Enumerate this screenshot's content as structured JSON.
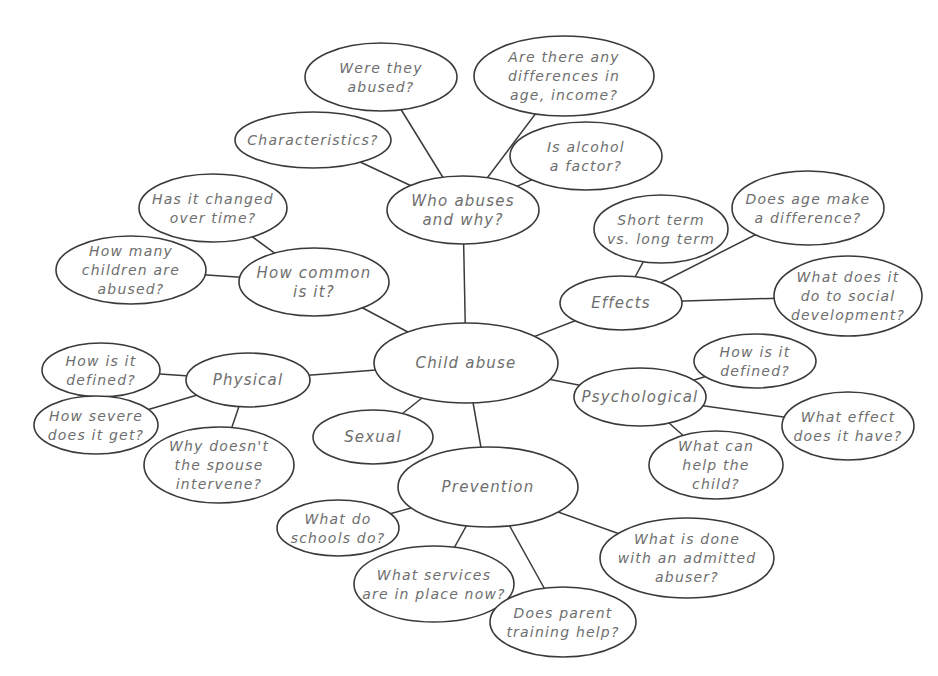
{
  "diagram": {
    "type": "mind-map",
    "colors": {
      "stroke": "#3a3a3a",
      "text": "#6e6e6e",
      "background": "#ffffff"
    },
    "nodes": [
      {
        "id": "child-abuse",
        "lines": [
          "Child abuse"
        ],
        "cx": 466,
        "cy": 363,
        "rx": 92,
        "ry": 40,
        "big": true
      },
      {
        "id": "who-abuses",
        "lines": [
          "Who abuses",
          "and why?"
        ],
        "cx": 463,
        "cy": 210,
        "rx": 76,
        "ry": 34,
        "big": true
      },
      {
        "id": "were-they-abused",
        "lines": [
          "Were they",
          "abused?"
        ],
        "cx": 381,
        "cy": 77,
        "rx": 76,
        "ry": 34
      },
      {
        "id": "differences",
        "lines": [
          "Are there any",
          "differences in",
          "age, income?"
        ],
        "cx": 564,
        "cy": 76,
        "rx": 90,
        "ry": 40
      },
      {
        "id": "characteristics",
        "lines": [
          "Characteristics?"
        ],
        "cx": 313,
        "cy": 140,
        "rx": 78,
        "ry": 28
      },
      {
        "id": "alcohol",
        "lines": [
          "Is alcohol",
          "a factor?"
        ],
        "cx": 586,
        "cy": 156,
        "rx": 76,
        "ry": 34
      },
      {
        "id": "how-common",
        "lines": [
          "How common",
          "is it?"
        ],
        "cx": 314,
        "cy": 282,
        "rx": 75,
        "ry": 34,
        "big": true
      },
      {
        "id": "changed-over-time",
        "lines": [
          "Has it changed",
          "over time?"
        ],
        "cx": 213,
        "cy": 208,
        "rx": 74,
        "ry": 34
      },
      {
        "id": "how-many-children",
        "lines": [
          "How many",
          "children are",
          "abused?"
        ],
        "cx": 131,
        "cy": 270,
        "rx": 75,
        "ry": 34
      },
      {
        "id": "effects",
        "lines": [
          "Effects"
        ],
        "cx": 621,
        "cy": 303,
        "rx": 61,
        "ry": 27,
        "big": true
      },
      {
        "id": "short-long-term",
        "lines": [
          "Short term",
          "vs. long term"
        ],
        "cx": 661,
        "cy": 229,
        "rx": 67,
        "ry": 34
      },
      {
        "id": "age-difference",
        "lines": [
          "Does age make",
          "a difference?"
        ],
        "cx": 808,
        "cy": 208,
        "rx": 76,
        "ry": 37
      },
      {
        "id": "social-development",
        "lines": [
          "What does it",
          "do to social",
          "development?"
        ],
        "cx": 848,
        "cy": 296,
        "rx": 74,
        "ry": 40
      },
      {
        "id": "psychological",
        "lines": [
          "Psychological"
        ],
        "cx": 640,
        "cy": 397,
        "rx": 66,
        "ry": 29,
        "big": true
      },
      {
        "id": "psych-defined",
        "lines": [
          "How is it",
          "defined?"
        ],
        "cx": 755,
        "cy": 361,
        "rx": 61,
        "ry": 27
      },
      {
        "id": "what-effect",
        "lines": [
          "What effect",
          "does it have?"
        ],
        "cx": 848,
        "cy": 426,
        "rx": 66,
        "ry": 34
      },
      {
        "id": "help-child",
        "lines": [
          "What can",
          "help the",
          "child?"
        ],
        "cx": 716,
        "cy": 465,
        "rx": 67,
        "ry": 34
      },
      {
        "id": "physical",
        "lines": [
          "Physical"
        ],
        "cx": 248,
        "cy": 380,
        "rx": 62,
        "ry": 27,
        "big": true
      },
      {
        "id": "phys-defined",
        "lines": [
          "How is it",
          "defined?"
        ],
        "cx": 101,
        "cy": 370,
        "rx": 59,
        "ry": 27
      },
      {
        "id": "how-severe",
        "lines": [
          "How severe",
          "does it get?"
        ],
        "cx": 96,
        "cy": 425,
        "rx": 62,
        "ry": 29
      },
      {
        "id": "spouse-intervene",
        "lines": [
          "Why doesn't",
          "the spouse",
          "intervene?"
        ],
        "cx": 219,
        "cy": 465,
        "rx": 75,
        "ry": 38
      },
      {
        "id": "sexual",
        "lines": [
          "Sexual"
        ],
        "cx": 373,
        "cy": 437,
        "rx": 60,
        "ry": 27,
        "big": true
      },
      {
        "id": "prevention",
        "lines": [
          "Prevention"
        ],
        "cx": 488,
        "cy": 487,
        "rx": 90,
        "ry": 40,
        "big": true
      },
      {
        "id": "schools",
        "lines": [
          "What do",
          "schools do?"
        ],
        "cx": 338,
        "cy": 528,
        "rx": 61,
        "ry": 28
      },
      {
        "id": "services",
        "lines": [
          "What services",
          "are in place now?"
        ],
        "cx": 434,
        "cy": 584,
        "rx": 80,
        "ry": 38
      },
      {
        "id": "parent-training",
        "lines": [
          "Does parent",
          "training help?"
        ],
        "cx": 563,
        "cy": 622,
        "rx": 73,
        "ry": 35
      },
      {
        "id": "admitted-abuser",
        "lines": [
          "What is done",
          "with an admitted",
          "abuser?"
        ],
        "cx": 687,
        "cy": 558,
        "rx": 87,
        "ry": 40
      }
    ],
    "edges": [
      [
        "child-abuse",
        "who-abuses"
      ],
      [
        "who-abuses",
        "were-they-abused"
      ],
      [
        "who-abuses",
        "differences"
      ],
      [
        "who-abuses",
        "characteristics"
      ],
      [
        "who-abuses",
        "alcohol"
      ],
      [
        "child-abuse",
        "how-common"
      ],
      [
        "how-common",
        "changed-over-time"
      ],
      [
        "how-common",
        "how-many-children"
      ],
      [
        "child-abuse",
        "effects"
      ],
      [
        "effects",
        "short-long-term"
      ],
      [
        "effects",
        "age-difference"
      ],
      [
        "effects",
        "social-development"
      ],
      [
        "child-abuse",
        "psychological"
      ],
      [
        "psychological",
        "psych-defined"
      ],
      [
        "psychological",
        "what-effect"
      ],
      [
        "psychological",
        "help-child"
      ],
      [
        "child-abuse",
        "physical"
      ],
      [
        "physical",
        "phys-defined"
      ],
      [
        "physical",
        "how-severe"
      ],
      [
        "physical",
        "spouse-intervene"
      ],
      [
        "child-abuse",
        "sexual"
      ],
      [
        "child-abuse",
        "prevention"
      ],
      [
        "prevention",
        "schools"
      ],
      [
        "prevention",
        "services"
      ],
      [
        "prevention",
        "parent-training"
      ],
      [
        "prevention",
        "admitted-abuser"
      ]
    ]
  }
}
